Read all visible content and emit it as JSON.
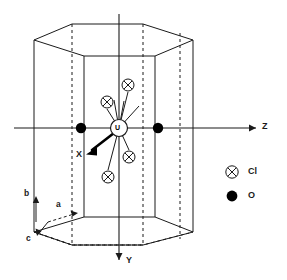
{
  "figure": {
    "type": "crystal-structure-diagram",
    "central_atom": {
      "label": "U",
      "x": 119,
      "y": 128,
      "r": 8.5
    },
    "cartesian_axes": [
      {
        "name": "Z",
        "label": "Z",
        "direction": "right",
        "x1": 14,
        "y1": 128,
        "x2": 258,
        "y2": 128,
        "label_x": 262,
        "label_y": 123
      },
      {
        "name": "Y",
        "label": "Y",
        "direction": "down",
        "x1": 119,
        "y1": 14,
        "x2": 119,
        "y2": 262,
        "label_x": 126,
        "label_y": 258
      },
      {
        "name": "X",
        "label": "X",
        "direction": "down-left-bold",
        "x1": 113,
        "y1": 134,
        "x2": 88,
        "y2": 153,
        "label_x": 79,
        "label_y": 153
      }
    ],
    "crystal_axes": [
      {
        "name": "b",
        "label": "b",
        "direction": "up",
        "x1": 36,
        "y1": 222,
        "x2": 36,
        "y2": 196,
        "label_x": 25,
        "label_y": 191
      },
      {
        "name": "a",
        "label": "a",
        "direction": "right-down",
        "x1": 48,
        "y1": 222,
        "x2": 78,
        "y2": 213,
        "label_x": 57,
        "label_y": 203
      },
      {
        "name": "c",
        "label": "c",
        "direction": "down-left",
        "x1": 48,
        "y1": 222,
        "x2": 38,
        "y2": 235,
        "label_x": 27,
        "label_y": 237
      }
    ],
    "atoms": [
      {
        "species": "Cl",
        "x": 128,
        "y": 85
      },
      {
        "species": "Cl",
        "x": 107,
        "y": 102
      },
      {
        "species": "Cl",
        "x": 129,
        "y": 157
      },
      {
        "species": "Cl",
        "x": 108,
        "y": 177
      },
      {
        "species": "O",
        "x": 81,
        "y": 128
      },
      {
        "species": "O",
        "x": 158,
        "y": 128
      }
    ],
    "bonds": [
      {
        "from": "U",
        "to_x": 128,
        "to_y": 92
      },
      {
        "from": "U",
        "to_x": 107,
        "to_y": 109
      },
      {
        "from": "U",
        "to_x": 129,
        "to_y": 150
      },
      {
        "from": "U",
        "to_x": 108,
        "to_y": 170
      },
      {
        "from": "U",
        "to_x": 137,
        "to_y": 107
      },
      {
        "from": "U",
        "to_x": 124,
        "to_y": 103
      }
    ]
  },
  "legend": {
    "title": "",
    "items": [
      {
        "symbol": "crossed-circle",
        "label": "Cl",
        "x": 232,
        "y": 172,
        "label_x": 248,
        "label_y": 167
      },
      {
        "symbol": "filled-circle",
        "label": "O",
        "x": 232,
        "y": 196,
        "label_x": 248,
        "label_y": 191
      }
    ]
  },
  "colors": {
    "line": "#1a1a1a",
    "dashed": "#1a1a1a",
    "fill_open": "#ffffff",
    "fill_solid": "#000000",
    "background": "#ffffff"
  },
  "cell": {
    "shape": "hexagonal-prism",
    "top_face_vertices": "34,40 72,24 143,24 193,40 155,56 84,56",
    "bottom_face_vertices": "34,232 72,245 143,245 193,232 155,217 84,217"
  }
}
